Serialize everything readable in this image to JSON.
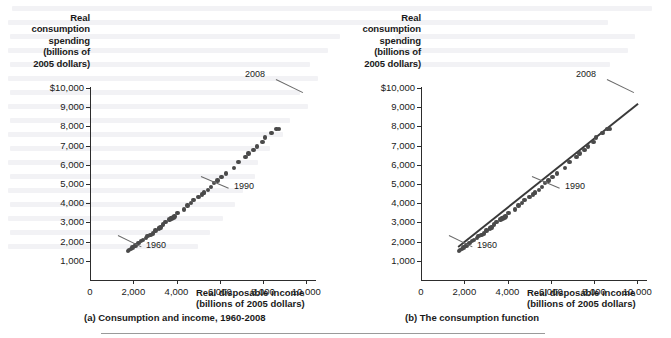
{
  "figure": {
    "background_color": "#ffffff",
    "dot_color": "#4a4a4a",
    "line_color": "#3a3a3a",
    "axis_color": "#2d2d2d"
  },
  "panels": [
    {
      "id": "a",
      "caption": "(a) Consumption and income, 1960-2008",
      "y_axis_title": "Real\nconsumption\nspending\n(billions of\n2005 dollars)",
      "x_axis_title": "Real disposable income\n(billions of 2005 dollars)",
      "y_ticks": [
        "$10,000",
        "9,000",
        "8,000",
        "7,000",
        "6,000",
        "5,000",
        "4,000",
        "3,000",
        "2,000",
        "1,000"
      ],
      "x_ticks": [
        "0",
        "2,000",
        "4,000",
        "6,000",
        "8,000",
        "10,000"
      ],
      "origin_label": "0",
      "annotations": [
        {
          "label": "1960"
        },
        {
          "label": "1990"
        },
        {
          "label": "2008"
        }
      ],
      "has_fit_line": false
    },
    {
      "id": "b",
      "caption": "(b)  The consumption function",
      "y_axis_title": "Real\nconsumption\nspending\n(billions of\n2005 dollars)",
      "x_axis_title": "Real disposable income\n(billions of 2005 dollars)",
      "y_ticks": [
        "$10,000",
        "9,000",
        "8,000",
        "7,000",
        "6,000",
        "5,000",
        "4,000",
        "3,000",
        "2,000",
        "1,000"
      ],
      "x_ticks": [
        "0",
        "2,000",
        "4,000",
        "6,000",
        "8,000",
        "10,000"
      ],
      "origin_label": "0",
      "annotations": [
        {
          "label": "1960"
        },
        {
          "label": "1990"
        },
        {
          "label": "2008"
        }
      ],
      "has_fit_line": true
    }
  ],
  "chart_data": {
    "type": "scatter",
    "xlabel": "Real disposable income (billions of 2005 dollars)",
    "ylabel": "Real consumption spending (billions of 2005 dollars)",
    "xlim": [
      0,
      10400
    ],
    "ylim": [
      0,
      10500
    ],
    "xticks": [
      0,
      2000,
      4000,
      6000,
      8000,
      10000
    ],
    "yticks": [
      1000,
      2000,
      3000,
      4000,
      5000,
      6000,
      7000,
      8000,
      9000,
      10000
    ],
    "grid": false,
    "legend": "none",
    "point_labels_shown": [
      "1960",
      "1990",
      "2008"
    ],
    "series": [
      {
        "name": "Real consumption vs real disposable income",
        "x_label": "Real disposable income",
        "y_label": "Real consumption spending",
        "years": [
          1960,
          1961,
          1962,
          1963,
          1964,
          1965,
          1966,
          1967,
          1968,
          1969,
          1970,
          1971,
          1972,
          1973,
          1974,
          1975,
          1976,
          1977,
          1978,
          1979,
          1980,
          1981,
          1982,
          1983,
          1984,
          1985,
          1986,
          1987,
          1988,
          1989,
          1990,
          1991,
          1992,
          1993,
          1994,
          1995,
          1996,
          1997,
          1998,
          1999,
          2000,
          2001,
          2002,
          2003,
          2004,
          2005,
          2006,
          2007,
          2008
        ],
        "x": [
          1759,
          1800,
          1886,
          1958,
          2108,
          2241,
          2369,
          2462,
          2578,
          2663,
          2796,
          2899,
          3020,
          3211,
          3187,
          3259,
          3384,
          3493,
          3670,
          3771,
          3775,
          3862,
          3907,
          4045,
          4343,
          4503,
          4668,
          4781,
          5006,
          5167,
          5280,
          5265,
          5452,
          5588,
          5745,
          5897,
          6070,
          6296,
          6663,
          6862,
          7194,
          7333,
          7563,
          7727,
          7973,
          8080,
          8397,
          8614,
          8731
        ],
        "y": [
          1597,
          1630,
          1711,
          1781,
          1888,
          2008,
          2121,
          2185,
          2310,
          2397,
          2452,
          2547,
          2700,
          2834,
          2815,
          2876,
          3035,
          3164,
          3303,
          3384,
          3374,
          3422,
          3470,
          3668,
          3863,
          4064,
          4228,
          4370,
          4547,
          4675,
          4770,
          4778,
          4934,
          5099,
          5290,
          5433,
          5619,
          5831,
          6126,
          6439,
          6739,
          6910,
          7099,
          7295,
          7561,
          7792,
          8029,
          8253,
          8268
        ],
        "note_units": "billions of 2005 dollars"
      }
    ],
    "fit_line": {
      "panel": "b",
      "description": "Consumption function — upward sloping straight line fitted through the scatter",
      "x_start": 1700,
      "y_start": 1860,
      "x_end": 10000,
      "y_end": 9680
    }
  }
}
